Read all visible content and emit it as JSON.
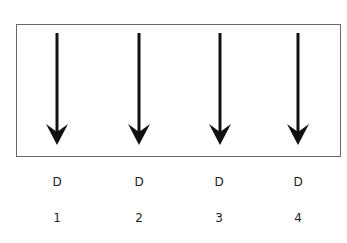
{
  "diagram": {
    "arrows": [
      {
        "x": 57,
        "label": "D",
        "index": "1"
      },
      {
        "x": 139,
        "label": "D",
        "index": "2"
      },
      {
        "x": 220,
        "label": "D",
        "index": "3"
      },
      {
        "x": 298,
        "label": "D",
        "index": "4"
      }
    ],
    "arrow_color": "#111111",
    "frame_color": "#6a6a6a"
  }
}
